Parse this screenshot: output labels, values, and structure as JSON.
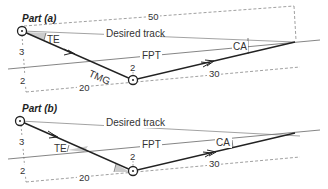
{
  "colors": {
    "track": "#999999",
    "fpt": "#777777",
    "tmg": "#222222",
    "dashed": "#888888",
    "shade": "#cccccc",
    "text": "#333333"
  },
  "part_a": {
    "title": "Part (a)",
    "desired_track_label": "Desired track",
    "fpt_label": "FPT",
    "tmg_label": "TMG",
    "te_label": "TE",
    "ca_label": "CA",
    "dim_top": "50",
    "dim_bottom_left": "20",
    "dim_bottom_right": "30",
    "dim_left_upper": "3",
    "dim_left_lower": "2",
    "dim_mid": "2"
  },
  "part_b": {
    "title": "Part (b)",
    "desired_track_label": "Desired track",
    "fpt_label": "FPT",
    "te_label": "TE",
    "ca_label": "CA",
    "dim_bottom_left": "20",
    "dim_bottom_right": "30",
    "dim_left_upper": "3",
    "dim_left_lower": "2",
    "dim_mid": "2"
  }
}
